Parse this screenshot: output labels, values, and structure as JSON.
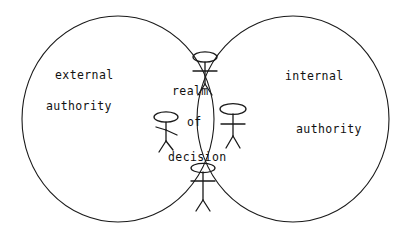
{
  "diagram": {
    "type": "venn-diagram",
    "title": "",
    "stroke_color": "#1a1a1a",
    "background_color": "#ffffff",
    "sets": [
      {
        "id": "left",
        "label_line1": "external",
        "label_line2": "authority"
      },
      {
        "id": "right",
        "label_line1": "internal",
        "label_line2": "authority"
      }
    ],
    "intersection": {
      "label_line1": "realm",
      "label_line2": "of",
      "label_line3": "decision",
      "figure_count": 4,
      "figures": [
        {
          "id": "figure-top",
          "name": "stick-figure"
        },
        {
          "id": "figure-left",
          "name": "stick-figure"
        },
        {
          "id": "figure-right",
          "name": "stick-figure"
        },
        {
          "id": "figure-bottom",
          "name": "stick-figure"
        }
      ]
    }
  }
}
